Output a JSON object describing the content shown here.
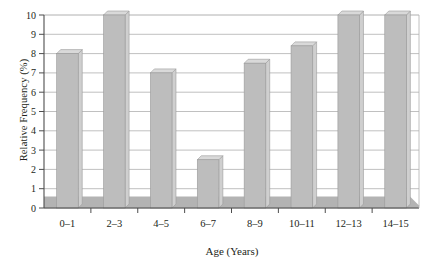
{
  "chart_data": {
    "type": "bar",
    "title": "",
    "xlabel": "Age (Years)",
    "ylabel": "Relative Frequency (%)",
    "categories": [
      "0–1",
      "2–3",
      "4–5",
      "6–7",
      "8–9",
      "10–11",
      "12–13",
      "14–15"
    ],
    "values": [
      8.0,
      10.0,
      7.0,
      2.5,
      7.5,
      8.4,
      10.0,
      10.0
    ],
    "ylim": [
      0,
      10
    ],
    "ytick_labels": [
      "0",
      "1",
      "2",
      "3",
      "4",
      "5",
      "6",
      "7",
      "8",
      "9",
      "10"
    ],
    "ytick_values": [
      0,
      1,
      2,
      3,
      4,
      5,
      6,
      7,
      8,
      9,
      10
    ],
    "ystep": 1,
    "grid": true,
    "grid_axis": "y",
    "legend": "none",
    "style": "3d-bars-grayscale",
    "bar_face_color": "#bdbdbd",
    "bar_top_color": "#d9d9d9",
    "bar_side_color": "#cfcfcf",
    "bar_outline_color": "#9a9a9a",
    "floor_color": "#b3b3b3",
    "floor_height_units": 0.6,
    "grid_color": "#b0b0b0",
    "axis_color": "#4d4d4d",
    "background_color": "#ffffff",
    "text_color": "#231f20"
  }
}
